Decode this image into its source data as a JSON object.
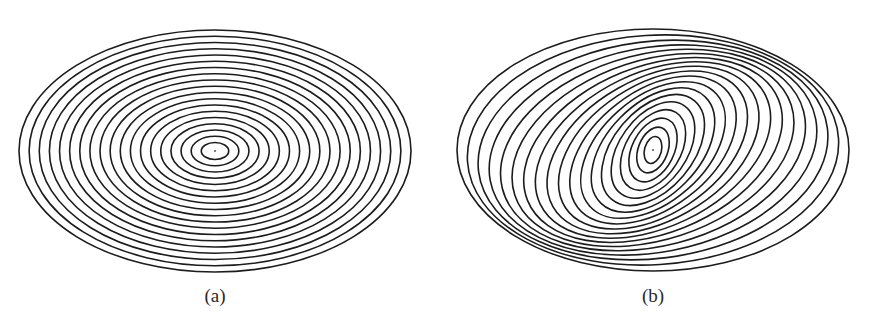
{
  "figure": {
    "panels": [
      {
        "id": "a",
        "label": "(a)",
        "description": "Concentric axis-aligned ellipses (level sets) around a center point",
        "ring_count": 19,
        "inner_scale": 0.07,
        "outer_scale": 1.0,
        "aspect_ratio_major_to_minor": 1.62,
        "tilt_inner_deg": 0,
        "tilt_outer_deg": 0,
        "center_dot": true,
        "stroke_color": "#1c1c1c"
      },
      {
        "id": "b",
        "label": "(b)",
        "description": "Nested ellipses whose orientation rotates from nearly vertical (inner) toward horizontal (outer), crowding at upper-right and lower-left",
        "ring_count": 19,
        "inner_scale": 0.07,
        "outer_scale": 1.0,
        "aspect_ratio_major_to_minor": 1.62,
        "tilt_inner_deg": -75,
        "tilt_outer_deg": 0,
        "center_dot": true,
        "stroke_color": "#1c1c1c"
      }
    ]
  }
}
